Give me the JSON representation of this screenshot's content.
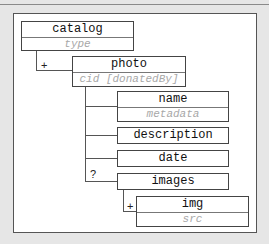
{
  "diagram": {
    "type": "xml-schema-tree",
    "nodes": [
      {
        "id": "catalog",
        "name": "catalog",
        "attributes": "type"
      },
      {
        "id": "photo",
        "name": "photo",
        "attributes": "cid [donatedBy]",
        "cardinality": "+",
        "parent": "catalog"
      },
      {
        "id": "name",
        "name": "name",
        "attributes": "metadata",
        "parent": "photo"
      },
      {
        "id": "description",
        "name": "description",
        "parent": "photo"
      },
      {
        "id": "date",
        "name": "date",
        "parent": "photo"
      },
      {
        "id": "images",
        "name": "images",
        "cardinality": "?",
        "parent": "photo"
      },
      {
        "id": "img",
        "name": "img",
        "attributes": "src",
        "cardinality": "+",
        "parent": "images"
      }
    ]
  },
  "labels": {
    "catalog": "catalog",
    "catalog_attr": "type",
    "photo": "photo",
    "photo_attr": "cid [donatedBy]",
    "photo_card": "+",
    "name": "name",
    "name_attr": "metadata",
    "description": "description",
    "date": "date",
    "images": "images",
    "images_card": "?",
    "img": "img",
    "img_attr": "src",
    "img_card": "+"
  }
}
